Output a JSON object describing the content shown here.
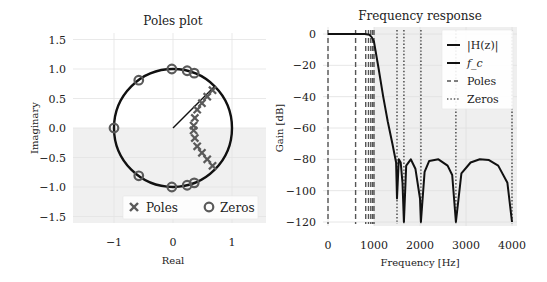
{
  "chart_data": [
    {
      "type": "scatter",
      "title": "Poles plot",
      "xlabel": "Real",
      "ylabel": "Imaginary",
      "xlim": [
        -1.7,
        1.55
      ],
      "ylim": [
        -1.6,
        1.6
      ],
      "xticks": [
        -1,
        0,
        1
      ],
      "xtick_labels": [
        "−1",
        "0",
        "1"
      ],
      "yticks": [
        1.5,
        1.0,
        0.5,
        0.0,
        -0.5,
        -1.0,
        -1.5
      ],
      "ytick_labels": [
        "1.5",
        "1.0",
        "0.5",
        "0.0",
        "−0.5",
        "−1.0",
        "−1.5"
      ],
      "grid": true,
      "legend_position": "lower right",
      "unit_circle": true,
      "cutoff_line": {
        "from": [
          0,
          0
        ],
        "to": [
          0.707,
          0.707
        ]
      },
      "series": [
        {
          "name": "Poles",
          "marker": "x",
          "color": "#5a5a5a",
          "points": [
            [
              0.67,
              0.64
            ],
            [
              0.58,
              0.53
            ],
            [
              0.49,
              0.42
            ],
            [
              0.41,
              0.31
            ],
            [
              0.37,
              0.17
            ],
            [
              0.35,
              0.04
            ],
            [
              0.67,
              -0.64
            ],
            [
              0.58,
              -0.53
            ],
            [
              0.49,
              -0.42
            ],
            [
              0.41,
              -0.31
            ],
            [
              0.37,
              -0.17
            ],
            [
              0.35,
              -0.04
            ]
          ]
        },
        {
          "name": "Zeros",
          "marker": "o",
          "color": "#5a5a5a",
          "points": [
            [
              -1.0,
              0.0
            ],
            [
              -0.58,
              0.81
            ],
            [
              -0.02,
              1.0
            ],
            [
              0.24,
              0.97
            ],
            [
              0.36,
              0.93
            ],
            [
              -0.58,
              -0.81
            ],
            [
              -0.02,
              -1.0
            ],
            [
              0.24,
              -0.97
            ],
            [
              0.36,
              -0.93
            ]
          ]
        }
      ]
    },
    {
      "type": "line",
      "title": "Frequency response",
      "xlabel": "Frequency [Hz]",
      "ylabel": "Gain [dB]",
      "xlim": [
        -100,
        4100
      ],
      "ylim": [
        -124,
        4
      ],
      "xticks": [
        0,
        1000,
        2000,
        3000,
        4000
      ],
      "xtick_labels": [
        "0",
        "1000",
        "2000",
        "3000",
        "4000"
      ],
      "yticks": [
        0,
        -20,
        -40,
        -60,
        -80,
        -100,
        -120
      ],
      "ytick_labels": [
        "0",
        "−20",
        "−40",
        "−60",
        "−80",
        "−100",
        "−120"
      ],
      "grid": true,
      "legend_position": "upper right",
      "stopband_shaded_from_hz": 1000,
      "cutoff_hz": 1000,
      "pole_freqs_hz": [
        0,
        600,
        820,
        880,
        930,
        970,
        1000
      ],
      "zero_freqs_hz": [
        1500,
        1650,
        2020,
        2780,
        4000
      ],
      "series": [
        {
          "name": "|H(z)|",
          "x": [
            0,
            200,
            400,
            600,
            800,
            900,
            950,
            1000,
            1100,
            1200,
            1300,
            1400,
            1480,
            1500,
            1540,
            1580,
            1620,
            1650,
            1700,
            1800,
            1900,
            2000,
            2020,
            2100,
            2200,
            2400,
            2600,
            2700,
            2780,
            2900,
            3100,
            3300,
            3500,
            3700,
            3900,
            4000
          ],
          "y": [
            0,
            0,
            0,
            0,
            0,
            -0.5,
            -2,
            -5,
            -22,
            -40,
            -56,
            -70,
            -82,
            -105,
            -80,
            -82,
            -95,
            -120,
            -84,
            -80,
            -86,
            -105,
            -120,
            -88,
            -81,
            -80,
            -84,
            -90,
            -120,
            -89,
            -82,
            -80,
            -80.5,
            -84,
            -95,
            -120
          ]
        }
      ],
      "legend": [
        "|H(z)|",
        "f_c",
        "Poles",
        "Zeros"
      ]
    }
  ]
}
